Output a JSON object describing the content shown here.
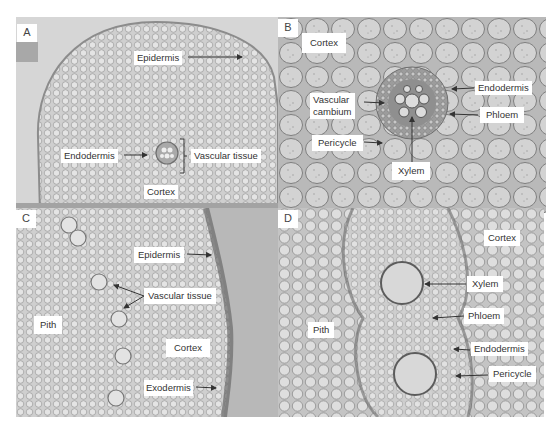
{
  "figure": {
    "panels": [
      {
        "id": "A",
        "label": "A",
        "annotations": {
          "epidermis": "Epidermis",
          "endodermis": "Endodermis",
          "vascular_tissue": "Vascular tissue",
          "cortex": "Cortex"
        }
      },
      {
        "id": "B",
        "label": "B",
        "annotations": {
          "cortex": "Cortex",
          "endodermis": "Endodermis",
          "vascular_cambium_1": "Vascular",
          "vascular_cambium_2": "cambium",
          "phloem": "Phloem",
          "pericycle": "Pericycle",
          "xylem": "Xylem"
        }
      },
      {
        "id": "C",
        "label": "C",
        "annotations": {
          "epidermis": "Epidermis",
          "vascular_tissue": "Vascular tissue",
          "pith": "Pith",
          "cortex": "Cortex",
          "exodermis": "Exodermis"
        }
      },
      {
        "id": "D",
        "label": "D",
        "annotations": {
          "cortex": "Cortex",
          "xylem": "Xylem",
          "phloem": "Phloem",
          "pith": "Pith",
          "endodermis": "Endodermis",
          "pericycle": "Pericycle"
        }
      }
    ],
    "colors": {
      "tissue_bg": "#c9c9c9",
      "cell_wall": "#8a8a8a",
      "label_bg": "#ffffff",
      "text": "#333333"
    }
  }
}
